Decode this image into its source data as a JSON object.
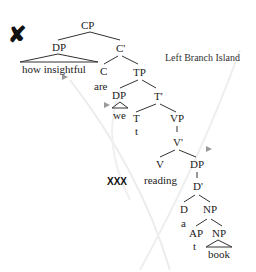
{
  "diagram": {
    "annotation": "Left Branch Island",
    "marker_mark": "✘",
    "marker_xxx": "XXX",
    "nodes": {
      "cp": "CP",
      "dp1": "DP",
      "how": "how insightful",
      "cbar": "C'",
      "c": "C",
      "are": "are",
      "tp": "TP",
      "dp2": "DP",
      "we": "we",
      "tbar": "T'",
      "t": "T",
      "t_trace": "t",
      "vp": "VP",
      "vbar": "V'",
      "v": "V",
      "reading": "reading",
      "dp3": "DP",
      "dbar": "D'",
      "d": "D",
      "a": "a",
      "np1": "NP",
      "ap": "AP",
      "ap_trace": "t",
      "np2": "NP",
      "book": "book"
    }
  }
}
